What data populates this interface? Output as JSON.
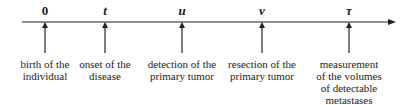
{
  "events": [
    {
      "symbol": "0",
      "x": 45,
      "label": "birth of the\nindividual"
    },
    {
      "symbol": "t",
      "x": 105,
      "label": "onset of the\ndisease"
    },
    {
      "symbol": "u",
      "x": 182,
      "label": "detection of the\nprimary tumor"
    },
    {
      "symbol": "v",
      "x": 262,
      "label": "resection of the\nprimary tumor"
    },
    {
      "symbol": "τ",
      "x": 349,
      "label": "measurement\nof the volumes\nof detectable\nmetastases"
    }
  ]
}
